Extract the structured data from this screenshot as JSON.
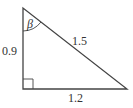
{
  "diagram": {
    "type": "right-triangle",
    "stroke_color": "#444444",
    "vertices": {
      "top": [
        23,
        8
      ],
      "right_angle": [
        23,
        89
      ],
      "bottom_right": [
        127,
        89
      ]
    },
    "labels": {
      "vertical_side": "0.9",
      "hypotenuse": "1.5",
      "horizontal_side": "1.2",
      "angle": "β"
    },
    "right_angle_marker": true
  }
}
